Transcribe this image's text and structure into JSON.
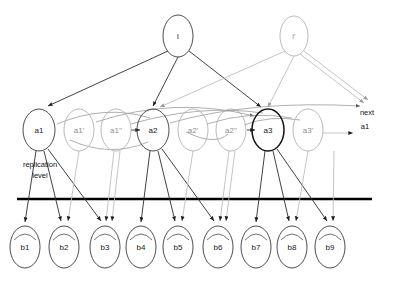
{
  "figure": {
    "title_fragment": "",
    "annotations": {
      "replication_level": {
        "line1": "replication",
        "line2": "level"
      },
      "next_pointer": {
        "line1": "next",
        "line2": "a1"
      }
    },
    "replication_line": {
      "y": 199,
      "x_start": 17,
      "x_end": 372,
      "color": "#000000"
    }
  },
  "colors": {
    "primary_stroke": "#2b2b2b",
    "secondary_stroke": "#bdbdbd",
    "arc_stroke": "#9a9a9a",
    "text": "#1a1a1a",
    "faded_text": "#8e8e8e",
    "rule": "#000000"
  },
  "nodes": {
    "top": [
      {
        "id": "l",
        "label": "l",
        "x": 178,
        "y": 36,
        "rx": 15,
        "ry": 21,
        "style": "dark"
      },
      {
        "id": "lp",
        "label": "l'",
        "x": 294,
        "y": 36,
        "rx": 14,
        "ry": 20,
        "style": "gray"
      }
    ],
    "middle": [
      {
        "id": "a1",
        "label": "a1",
        "x": 39,
        "y": 130,
        "rx": 16,
        "ry": 21,
        "style": "dark"
      },
      {
        "id": "a1p",
        "label": "a1'",
        "x": 79,
        "y": 130,
        "rx": 15,
        "ry": 21,
        "style": "gray"
      },
      {
        "id": "a1pp",
        "label": "a1''",
        "x": 116,
        "y": 130,
        "rx": 15,
        "ry": 21,
        "style": "gray"
      },
      {
        "id": "a2",
        "label": "a2",
        "x": 153,
        "y": 130,
        "rx": 16,
        "ry": 21,
        "style": "dark"
      },
      {
        "id": "a2p",
        "label": "a2'",
        "x": 193,
        "y": 130,
        "rx": 15,
        "ry": 21,
        "style": "gray"
      },
      {
        "id": "a2pp",
        "label": "a2''",
        "x": 231,
        "y": 130,
        "rx": 15,
        "ry": 21,
        "style": "gray"
      },
      {
        "id": "a3",
        "label": "a3",
        "x": 268,
        "y": 130,
        "rx": 16,
        "ry": 21,
        "style": "bold"
      },
      {
        "id": "a3p",
        "label": "a3'",
        "x": 308,
        "y": 130,
        "rx": 15,
        "ry": 21,
        "style": "gray"
      }
    ],
    "bottom": [
      {
        "id": "b1",
        "label": "b1",
        "x": 25,
        "y": 247,
        "rx": 15,
        "ry": 21
      },
      {
        "id": "b2",
        "label": "b2",
        "x": 64,
        "y": 247,
        "rx": 15,
        "ry": 21
      },
      {
        "id": "b3",
        "label": "b3",
        "x": 105,
        "y": 247,
        "rx": 15,
        "ry": 21
      },
      {
        "id": "b4",
        "label": "b4",
        "x": 141,
        "y": 247,
        "rx": 15,
        "ry": 21
      },
      {
        "id": "b5",
        "label": "b5",
        "x": 178,
        "y": 247,
        "rx": 15,
        "ry": 21
      },
      {
        "id": "b6",
        "label": "b6",
        "x": 218,
        "y": 247,
        "rx": 15,
        "ry": 21
      },
      {
        "id": "b7",
        "label": "b7",
        "x": 256,
        "y": 247,
        "rx": 15,
        "ry": 21
      },
      {
        "id": "b8",
        "label": "b8",
        "x": 292,
        "y": 247,
        "rx": 15,
        "ry": 21
      },
      {
        "id": "b9",
        "label": "b9",
        "x": 330,
        "y": 247,
        "rx": 15,
        "ry": 21
      }
    ]
  },
  "edges": {
    "top_to_middle_dark": [
      {
        "from": "l",
        "to": "a1"
      },
      {
        "from": "l",
        "to": "a2"
      },
      {
        "from": "l",
        "to": "a3"
      }
    ],
    "top_to_middle_gray": [
      {
        "from": "lp",
        "to": "a1"
      },
      {
        "from": "lp",
        "to": "a2"
      },
      {
        "from": "lp",
        "to": "a3"
      },
      {
        "from": "lp",
        "to": "next"
      }
    ],
    "chain_arrows": [
      {
        "from": "a1pp",
        "to": "a2"
      },
      {
        "from": "a2pp",
        "to": "a3"
      },
      {
        "from": "a3p",
        "to": "next"
      }
    ],
    "middle_to_bottom": [
      {
        "from": "a1",
        "to": "b2"
      },
      {
        "from": "a1",
        "to": "b3"
      },
      {
        "from": "a1",
        "to": "b1"
      },
      {
        "from": "a1p",
        "to": "b3"
      },
      {
        "from": "a1pp",
        "to": "b3"
      },
      {
        "from": "a2",
        "to": "b5"
      },
      {
        "from": "a2",
        "to": "b6"
      },
      {
        "from": "a2",
        "to": "b4"
      },
      {
        "from": "a2p",
        "to": "b6"
      },
      {
        "from": "a2pp",
        "to": "b6"
      },
      {
        "from": "a3",
        "to": "b8"
      },
      {
        "from": "a3",
        "to": "b9"
      },
      {
        "from": "a3",
        "to": "b7"
      },
      {
        "from": "a3p",
        "to": "b9"
      }
    ]
  }
}
